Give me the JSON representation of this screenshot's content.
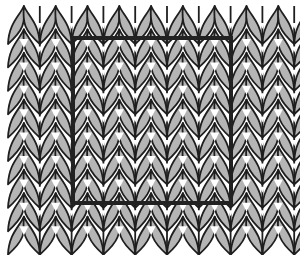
{
  "figure": {
    "colors": {
      "stitch_fill": "#b5b5b5",
      "stitch_outline": "#1f1f1f",
      "background": "#ffffff",
      "gap": "#ffffff",
      "frame": "#222222"
    },
    "grid": {
      "columns": 10,
      "rows": 10,
      "first_spine_x": 8,
      "column_spacing": 31.8,
      "half_width": 15.9,
      "top_y": 6,
      "row_spacing": 23.4,
      "leaf_length": 38
    },
    "measurement_frame": {
      "x": 73,
      "y": 38,
      "width": 158,
      "height": 165,
      "stroke_width": 4
    }
  }
}
